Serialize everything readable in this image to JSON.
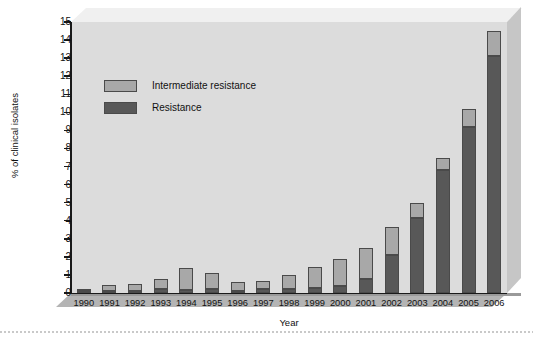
{
  "chart_data": {
    "type": "bar",
    "stacked": true,
    "title": "",
    "xlabel": "Year",
    "ylabel": "% of clinical isolates",
    "categories": [
      "1990",
      "1991",
      "1992",
      "1993",
      "1994",
      "1995",
      "1996",
      "1997",
      "1998",
      "1999",
      "2000",
      "2001",
      "2002",
      "2003",
      "2004",
      "2005",
      "2006"
    ],
    "series": [
      {
        "name": "Resistance",
        "color": "#585858",
        "values": [
          0.1,
          0.1,
          0.1,
          0.2,
          0.15,
          0.2,
          0.1,
          0.2,
          0.2,
          0.3,
          0.4,
          0.8,
          2.1,
          4.15,
          6.8,
          9.2,
          13.1
        ]
      },
      {
        "name": "Intermediate resistance",
        "color": "#a8a8a8",
        "values": [
          0.1,
          0.35,
          0.4,
          0.6,
          1.25,
          0.9,
          0.5,
          0.45,
          0.8,
          1.15,
          1.5,
          1.7,
          1.55,
          0.85,
          0.7,
          1.0,
          1.4
        ]
      }
    ],
    "totals": [
      0.2,
      0.45,
      0.5,
      0.8,
      1.4,
      1.1,
      0.6,
      0.65,
      1.0,
      1.45,
      1.9,
      2.5,
      3.65,
      5.0,
      7.5,
      10.2,
      14.5
    ],
    "ylim": [
      0,
      15
    ],
    "yticks": [
      "0",
      "1",
      "2",
      "3",
      "4",
      "5",
      "6",
      "7",
      "8",
      "9",
      "10",
      "11",
      "12",
      "13",
      "14",
      "15"
    ],
    "grid": false,
    "legend_position": "upper-left-inside"
  },
  "legend": {
    "items": [
      {
        "label": "Intermediate resistance",
        "swatch": "#a8a8a8"
      },
      {
        "label": "Resistance",
        "swatch": "#585858"
      }
    ]
  },
  "axes": {
    "y_title": "% of clinical isolates",
    "x_title": "Year"
  }
}
